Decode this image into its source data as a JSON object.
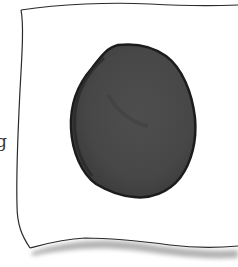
{
  "illustration": {
    "description": "Hand-drawn sheet of paper with a large dark blob in the center",
    "edge_glyph": "g",
    "colors": {
      "background": "#ffffff",
      "paper": "#ffffff",
      "paper_outline": "#2a2a2a",
      "paper_shadow": "#9a9a9a",
      "blob_fill": "#484848",
      "blob_outline": "#1c1c1c",
      "blob_shade": "#3c3c3c"
    },
    "blob": {
      "shape": "egg",
      "bbox": {
        "x": 71,
        "y": 44,
        "width": 125,
        "height": 155
      }
    },
    "paper": {
      "shape": "wavy-sheet",
      "top_left": [
        21,
        10
      ],
      "bottom_left": [
        30,
        248
      ]
    }
  }
}
